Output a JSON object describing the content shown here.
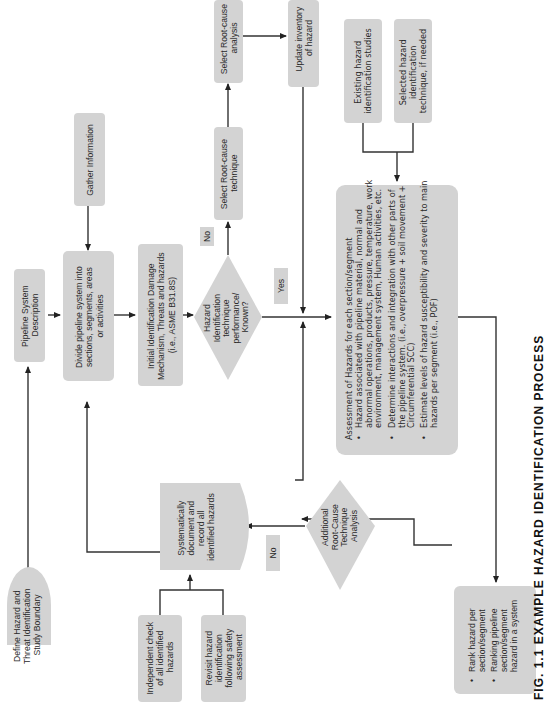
{
  "diagram": {
    "orientation": "rotated 90 degrees counter-clockwise",
    "colors": {
      "box_fill": "#d3d3d3",
      "line": "#333333",
      "text": "#2a2a2a"
    },
    "nodes": {
      "define_boundary": {
        "lines": [
          "Define Hazard and",
          "Threat Identification",
          "Study Boundary"
        ]
      },
      "pipeline_description": {
        "lines": [
          "Pipeline System",
          "Description"
        ]
      },
      "gather_information": {
        "lines": [
          "Gather Information"
        ]
      },
      "divide_pipeline": {
        "lines": [
          "Divide pipeline system into",
          "sections, segments, areas",
          "or activities"
        ]
      },
      "initial_identification": {
        "lines": [
          "Initial Identification Damage",
          "Mechanism, Threats and hazards",
          "(i.e., ASME B31.8S)"
        ]
      },
      "decision_known": {
        "lines": [
          "Hazard",
          "Identification",
          "technique",
          "performance/",
          "Known?"
        ]
      },
      "select_technique": {
        "lines": [
          "Select Root-cause",
          "technique"
        ]
      },
      "select_analysis": {
        "lines": [
          "Select Root-cause",
          "analysis"
        ]
      },
      "update_inventory": {
        "lines": [
          "Update inventory",
          "of hazard"
        ]
      },
      "existing_studies": {
        "lines": [
          "Existing hazard",
          "identification studies"
        ]
      },
      "selected_technique": {
        "lines": [
          "Selected hazard",
          "identification",
          "technique, if needed"
        ]
      },
      "assessment": {
        "title": "Assessment of Hazards for each section/segment",
        "bullets": [
          [
            "Hazard associated with pipeline material, normal and",
            "abnormal operations, products, pressure, temperature, work",
            "environment, management system, Human activities, etc."
          ],
          [
            "Determine interactions and integration with other parts of",
            "the pipeline system. (i.e., overpressure + soil movement +",
            "Circumferential SCC)"
          ],
          [
            "Estimate levels of hazard susceptibility and severity to main",
            "hazards per segment (i.e., POF)"
          ]
        ]
      },
      "rank": {
        "bullets": [
          [
            "Rank hazard per",
            "section/segment"
          ],
          [
            "Ranking pipeline",
            "section/segment",
            "hazard in a system"
          ]
        ]
      },
      "decision_additional": {
        "lines": [
          "Additional",
          "Root-Cause",
          "Technique",
          "Analysis"
        ]
      },
      "document_record": {
        "lines": [
          "Systematically",
          "document and",
          "record all",
          "identified hazards"
        ]
      },
      "independent_check": {
        "lines": [
          "Independent check",
          "of all identified",
          "hazards"
        ]
      },
      "revisit": {
        "lines": [
          "Revisit hazard",
          "identification",
          "following safety",
          "assessment"
        ]
      }
    },
    "labels": {
      "no_top": "No",
      "yes": "Yes",
      "no_bottom": "No"
    },
    "caption": "FIG. 1.1  EXAMPLE HAZARD IDENTIFICATION PROCESS"
  }
}
